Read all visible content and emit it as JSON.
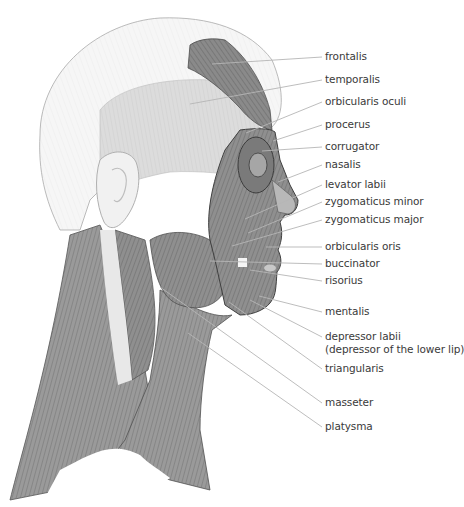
{
  "figure": {
    "colors": {
      "muscle_dark": "#6e6e6e",
      "muscle_mid": "#8c8c8c",
      "muscle_light": "#bdbdbd",
      "skull_light": "#efefef",
      "leader_line": "#b5b5b5",
      "text": "#3a3a3a"
    }
  },
  "labels": [
    {
      "id": "frontalis",
      "text": "frontalis",
      "y": 57,
      "from": [
        212,
        64
      ]
    },
    {
      "id": "temporalis",
      "text": "temporalis",
      "y": 80,
      "from": [
        190,
        104
      ]
    },
    {
      "id": "orbicularis-oculi",
      "text": "orbicularis oculi",
      "y": 102,
      "from": [
        246,
        133
      ]
    },
    {
      "id": "procerus",
      "text": "procerus",
      "y": 125,
      "from": [
        273,
        141
      ]
    },
    {
      "id": "corrugator",
      "text": "corrugator",
      "y": 147,
      "from": [
        262,
        151
      ]
    },
    {
      "id": "nasalis",
      "text": "nasalis",
      "y": 165,
      "from": [
        278,
        182
      ]
    },
    {
      "id": "levator-labii",
      "text": "levator labii",
      "y": 185,
      "from": [
        245,
        219
      ]
    },
    {
      "id": "zygomaticus-minor",
      "text": "zygomaticus minor",
      "y": 202,
      "from": [
        248,
        233
      ]
    },
    {
      "id": "zygomaticus-major",
      "text": "zygomaticus major",
      "y": 220,
      "from": [
        232,
        246
      ]
    },
    {
      "id": "orbicularis-oris",
      "text": "orbicularis oris",
      "y": 247,
      "from": [
        266,
        247
      ]
    },
    {
      "id": "buccinator",
      "text": "buccinator",
      "y": 264,
      "from": [
        210,
        261
      ]
    },
    {
      "id": "risorius",
      "text": "risorius",
      "y": 281,
      "from": [
        250,
        270
      ]
    },
    {
      "id": "mentalis",
      "text": "mentalis",
      "y": 312,
      "from": [
        259,
        296
      ]
    },
    {
      "id": "depressor-labii",
      "text": "depressor labii",
      "subtext": "(depressor of the lower lip)",
      "y": 337,
      "from": [
        250,
        300
      ]
    },
    {
      "id": "triangularis",
      "text": "triangularis",
      "y": 369,
      "from": [
        229,
        302
      ]
    },
    {
      "id": "masseter",
      "text": "masseter",
      "y": 403,
      "from": [
        160,
        287
      ]
    },
    {
      "id": "platysma",
      "text": "platysma",
      "y": 427,
      "from": [
        188,
        333
      ]
    }
  ]
}
